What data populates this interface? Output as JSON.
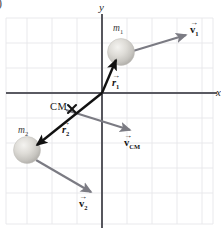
{
  "figure": {
    "corner_label": ")",
    "axes": {
      "y_label": "y",
      "x_label": "x",
      "origin_x": 102,
      "origin_y": 93
    },
    "grid": {
      "left": 6,
      "top": 18,
      "right": 213,
      "bottom": 224,
      "spacing": 25,
      "line_color": "#e3e3e8",
      "border_color": "#dcdce2"
    },
    "colors": {
      "axis": "#5a5a62",
      "position_vector": "#111111",
      "velocity_vector": "#7b7b83",
      "sphere_light": "#eceae6",
      "sphere_mid": "#cfcdc8",
      "sphere_dark": "#b4b2ad",
      "text": "#141414"
    },
    "masses": [
      {
        "name": "m1",
        "label_text": "m",
        "label_sub": "1",
        "label_x": 113,
        "label_y": 24,
        "cx": 121,
        "cy": 52,
        "r": 13
      },
      {
        "name": "m2",
        "label_text": "m",
        "label_sub": "2",
        "label_x": 18,
        "label_y": 126,
        "cx": 27,
        "cy": 150,
        "r": 13
      }
    ],
    "center_of_mass": {
      "label": "CM",
      "label_x": 50,
      "label_y": 103,
      "marker_x": 72,
      "marker_y": 109,
      "marker_glyph": "cross-marker"
    },
    "vectors": [
      {
        "name": "r1",
        "kind": "position",
        "symbol": "r",
        "subscript": "1",
        "italic": true,
        "x1": 102,
        "y1": 93,
        "x2": 115,
        "y2": 59,
        "label_x": 112,
        "label_y": 79
      },
      {
        "name": "r2",
        "kind": "position",
        "symbol": "r",
        "subscript": "2",
        "italic": true,
        "x1": 102,
        "y1": 93,
        "x2": 34,
        "y2": 147,
        "label_x": 62,
        "label_y": 126
      },
      {
        "name": "v1",
        "kind": "velocity",
        "symbol": "v",
        "subscript": "1",
        "italic": false,
        "x1": 133,
        "y1": 51,
        "x2": 190,
        "y2": 34,
        "label_x": 190,
        "label_y": 26
      },
      {
        "name": "vCM",
        "kind": "velocity",
        "symbol": "v",
        "subscript": "CM",
        "italic": false,
        "x1": 66,
        "y1": 110,
        "x2": 134,
        "y2": 131,
        "label_x": 125,
        "label_y": 139
      },
      {
        "name": "v2",
        "kind": "velocity",
        "symbol": "v",
        "subscript": "2",
        "italic": false,
        "x1": 36,
        "y1": 160,
        "x2": 95,
        "y2": 195,
        "label_x": 79,
        "label_y": 200
      }
    ]
  }
}
